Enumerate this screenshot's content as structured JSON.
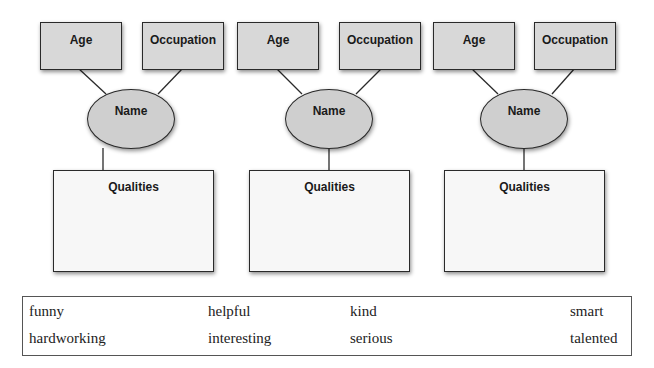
{
  "groups": [
    {
      "age": "Age",
      "occupation": "Occupation",
      "name": "Name",
      "qualities": "Qualities"
    },
    {
      "age": "Age",
      "occupation": "Occupation",
      "name": "Name",
      "qualities": "Qualities"
    },
    {
      "age": "Age",
      "occupation": "Occupation",
      "name": "Name",
      "qualities": "Qualities"
    }
  ],
  "word_bank": {
    "rows": [
      [
        "funny",
        "helpful",
        "kind",
        "smart"
      ],
      [
        "hardworking",
        "interesting",
        "serious",
        "talented"
      ]
    ]
  },
  "colors": {
    "node_fill": "#d8d8d8",
    "qualities_fill": "#f7f7f7",
    "border": "#2a2a2a"
  }
}
